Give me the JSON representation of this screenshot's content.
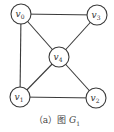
{
  "graph": {
    "name": "G1",
    "nodes": [
      {
        "id": "v0",
        "base": "v",
        "sub": "0"
      },
      {
        "id": "v1",
        "base": "v",
        "sub": "1"
      },
      {
        "id": "v2",
        "base": "v",
        "sub": "2"
      },
      {
        "id": "v3",
        "base": "v",
        "sub": "3"
      },
      {
        "id": "v4",
        "base": "v",
        "sub": "4"
      }
    ],
    "edges": [
      [
        "v0",
        "v3"
      ],
      [
        "v0",
        "v1"
      ],
      [
        "v0",
        "v4"
      ],
      [
        "v3",
        "v4"
      ],
      [
        "v4",
        "v1"
      ],
      [
        "v4",
        "v2"
      ],
      [
        "v1",
        "v2"
      ]
    ]
  },
  "caption": {
    "prefix": "（a）图 ",
    "graph_letter": "G",
    "graph_sub": "1"
  },
  "colors": {
    "stroke": "#3a3a3a",
    "text": "#333333",
    "background": "#ffffff"
  }
}
